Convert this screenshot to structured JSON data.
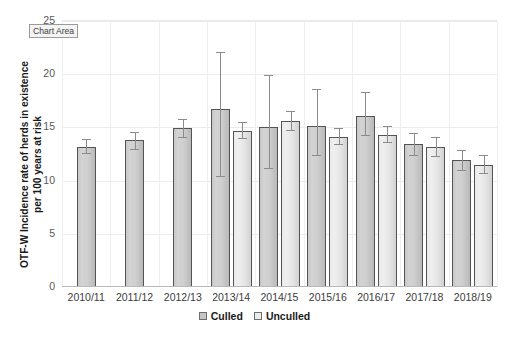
{
  "overlay": {
    "chart_area_tooltip": "Chart Area"
  },
  "legend": {
    "items": [
      {
        "label": "Culled",
        "swatch": "culled",
        "color": "#c6c6c6"
      },
      {
        "label": "Unculled",
        "swatch": "unculled",
        "color": "#ececec"
      }
    ]
  },
  "chart_data": {
    "type": "bar",
    "title": "",
    "subtitle": "",
    "xlabel": "",
    "ylabel": "OTF-W Incidence rate of herds in existence per 100 years at risk",
    "ylim": [
      0,
      25
    ],
    "yticks": [
      0,
      5,
      10,
      15,
      20,
      25
    ],
    "ytick_labels": [
      "0",
      "5",
      "10",
      "15",
      "20",
      "25"
    ],
    "grid": true,
    "legend_position": "bottom-center",
    "error_bars": "95% confidence interval",
    "categories": [
      "2010/11",
      "2011/12",
      "2012/13",
      "2013/14",
      "2014/15",
      "2015/16",
      "2016/17",
      "2017/18",
      "2018/19"
    ],
    "series": [
      {
        "name": "Culled",
        "color": "#c6c6c6",
        "values": [
          13.2,
          13.8,
          14.9,
          16.7,
          15.0,
          15.1,
          16.1,
          13.4,
          11.9
        ],
        "err_low": [
          12.6,
          13.0,
          14.1,
          10.4,
          11.2,
          12.4,
          14.3,
          12.4,
          11.0
        ],
        "err_high": [
          13.9,
          14.6,
          15.8,
          22.1,
          19.9,
          18.6,
          18.3,
          14.5,
          12.9
        ]
      },
      {
        "name": "Unculled",
        "color": "#ececec",
        "values": [
          null,
          null,
          null,
          14.7,
          15.6,
          14.1,
          14.3,
          13.2,
          11.5
        ],
        "err_low": [
          null,
          null,
          null,
          14.0,
          14.8,
          13.4,
          13.6,
          12.3,
          10.7
        ],
        "err_high": [
          null,
          null,
          null,
          15.5,
          16.5,
          14.9,
          15.1,
          14.1,
          12.4
        ]
      }
    ]
  }
}
